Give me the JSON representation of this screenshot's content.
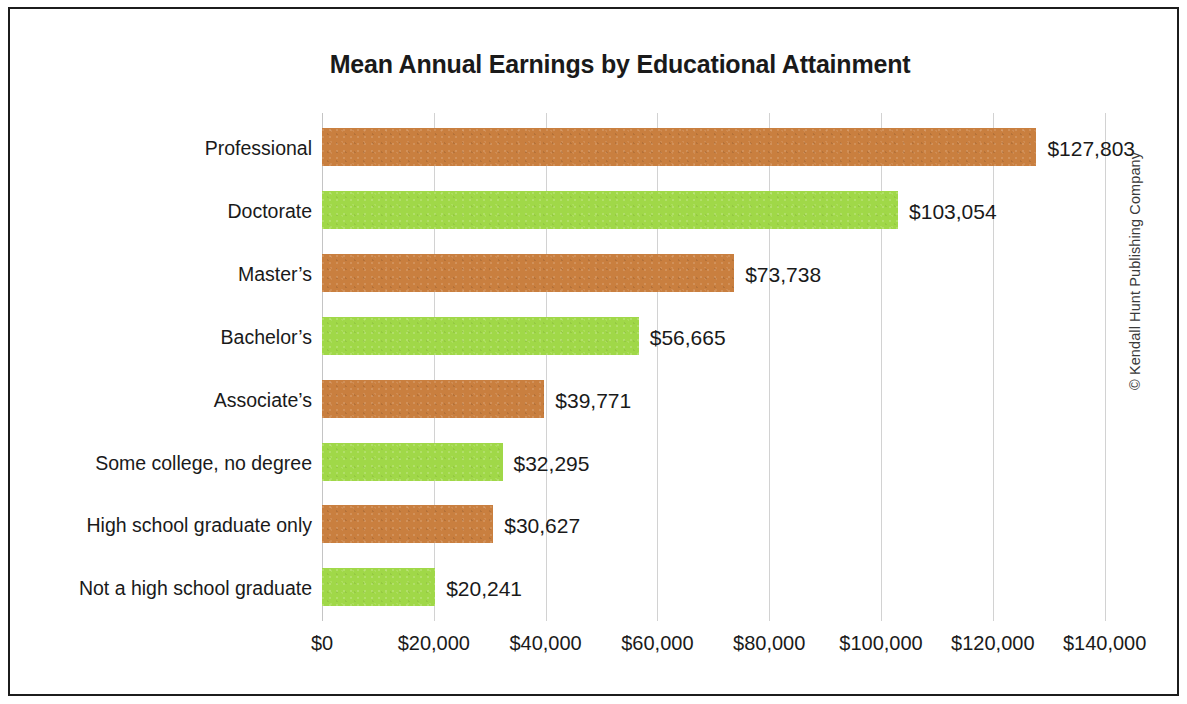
{
  "chart_data": {
    "type": "bar",
    "orientation": "horizontal",
    "title": "Mean Annual Earnings by Educational Attainment",
    "xlabel": "",
    "ylabel": "",
    "xlim": [
      0,
      140000
    ],
    "grid": true,
    "legend": "none",
    "categories": [
      "Professional",
      "Doctorate",
      "Master’s",
      "Bachelor’s",
      "Associate’s",
      "Some college, no degree",
      "High school graduate only",
      "Not a high school graduate"
    ],
    "values": [
      127803,
      103054,
      73738,
      56665,
      39771,
      32295,
      30627,
      20241
    ],
    "value_labels": [
      "$127,803",
      "$103,054",
      "$73,738",
      "$56,665",
      "$39,771",
      "$32,295",
      "$30,627",
      "$20,241"
    ],
    "bar_colors": [
      "#c97f3f",
      "#a0d848",
      "#c97f3f",
      "#a0d848",
      "#c97f3f",
      "#a0d848",
      "#c97f3f",
      "#a0d848"
    ],
    "xticks": [
      0,
      20000,
      40000,
      60000,
      80000,
      100000,
      120000,
      140000
    ],
    "xtick_labels": [
      "$0",
      "$20,000",
      "$40,000",
      "$60,000",
      "$80,000",
      "$100,000",
      "$120,000",
      "$140,000"
    ]
  },
  "colors": {
    "orange": "#c97f3f",
    "green": "#a0d848",
    "gridline": "#d2d2d2",
    "border": "#1c1c1c",
    "text": "#1a1a1a",
    "background": "#ffffff"
  },
  "credit": {
    "text": "© Kendall Hunt Publishing Company"
  }
}
